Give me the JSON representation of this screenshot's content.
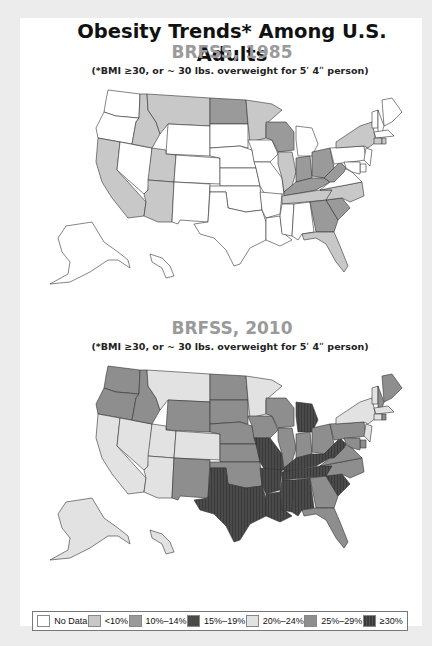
{
  "header": {
    "title": "Obesity Trends* Among U.S. Adults",
    "note": "(*BMI ≥30, or ~ 30 lbs. overweight for 5ʹ 4ʺ person)"
  },
  "maps": [
    {
      "subtitle": "BRFSS, 1985"
    },
    {
      "subtitle": "BRFSS, 2010"
    }
  ],
  "legend": {
    "items": [
      {
        "label": "No Data",
        "color": "#ffffff"
      },
      {
        "label": "<10%",
        "color": "#c8c8c8"
      },
      {
        "label": "10%–14%",
        "color": "#9a9a9a"
      },
      {
        "label": "15%–19%",
        "color": "#4a4a4a"
      },
      {
        "label": "20%–24%",
        "color": "#e2e2e2"
      },
      {
        "label": "25%–29%",
        "color": "#8e8e8e"
      },
      {
        "label": "≥30%",
        "color": "#3a3a3a"
      }
    ]
  },
  "chart_data": [
    {
      "type": "heatmap",
      "title": "Obesity Trends* Among U.S. Adults — BRFSS, 1985",
      "subtitle": "(*BMI ≥30, or ~ 30 lbs. overweight for 5' 4\" person)",
      "legend_categories": [
        "No Data",
        "<10%",
        "10%–14%",
        "15%–19%",
        "20%–24%",
        "25%–29%",
        "≥30%"
      ],
      "states": {
        "WA": "No Data",
        "OR": "No Data",
        "CA": "<10%",
        "NV": "No Data",
        "ID": "<10%",
        "MT": "<10%",
        "WY": "No Data",
        "UT": "<10%",
        "AZ": "<10%",
        "CO": "No Data",
        "NM": "No Data",
        "ND": "10%–14%",
        "SD": "No Data",
        "NE": "No Data",
        "KS": "No Data",
        "OK": "No Data",
        "TX": "No Data",
        "MN": "<10%",
        "IA": "No Data",
        "MO": "No Data",
        "AR": "No Data",
        "LA": "No Data",
        "WI": "10%–14%",
        "IL": "<10%",
        "MI": "No Data",
        "IN": "10%–14%",
        "OH": "10%–14%",
        "KY": "10%–14%",
        "TN": "<10%",
        "MS": "No Data",
        "AL": "No Data",
        "GA": "10%–14%",
        "FL": "<10%",
        "SC": "10%–14%",
        "NC": "<10%",
        "VA": "No Data",
        "WV": "10%–14%",
        "PA": "No Data",
        "NY": "<10%",
        "ME": "No Data",
        "VT": "No Data",
        "NH": "No Data",
        "MA": "No Data",
        "CT": "<10%",
        "RI": "<10%",
        "NJ": "No Data",
        "DE": "No Data",
        "MD": "No Data",
        "AK": "No Data",
        "HI": "No Data"
      }
    },
    {
      "type": "heatmap",
      "title": "Obesity Trends* Among U.S. Adults — BRFSS, 2010",
      "subtitle": "(*BMI ≥30, or ~ 30 lbs. overweight for 5' 4\" person)",
      "legend_categories": [
        "No Data",
        "<10%",
        "10%–14%",
        "15%–19%",
        "20%–24%",
        "25%–29%",
        "≥30%"
      ],
      "states": {
        "WA": "25%–29%",
        "OR": "25%–29%",
        "CA": "20%–24%",
        "NV": "20%–24%",
        "ID": "25%–29%",
        "MT": "20%–24%",
        "WY": "25%–29%",
        "UT": "20%–24%",
        "AZ": "20%–24%",
        "CO": "20%–24%",
        "NM": "25%–29%",
        "ND": "25%–29%",
        "SD": "25%–29%",
        "NE": "25%–29%",
        "KS": "25%–29%",
        "OK": "25%–29%",
        "TX": "≥30%",
        "MN": "20%–24%",
        "IA": "25%–29%",
        "MO": "≥30%",
        "AR": "≥30%",
        "LA": "≥30%",
        "WI": "25%–29%",
        "IL": "25%–29%",
        "MI": "≥30%",
        "IN": "25%–29%",
        "OH": "25%–29%",
        "KY": "≥30%",
        "TN": "≥30%",
        "MS": "≥30%",
        "AL": "≥30%",
        "GA": "25%–29%",
        "FL": "25%–29%",
        "SC": "≥30%",
        "NC": "25%–29%",
        "VA": "25%–29%",
        "WV": "≥30%",
        "PA": "25%–29%",
        "NY": "20%–24%",
        "ME": "25%–29%",
        "VT": "20%–24%",
        "NH": "25%–29%",
        "MA": "20%–24%",
        "CT": "20%–24%",
        "RI": "25%–29%",
        "NJ": "20%–24%",
        "DE": "25%–29%",
        "MD": "25%–29%",
        "AK": "20%–24%",
        "HI": "20%–24%"
      }
    }
  ]
}
